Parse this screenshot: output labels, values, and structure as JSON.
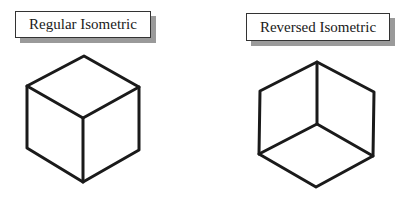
{
  "diagrams": [
    {
      "label": "Regular Isometric",
      "type": "cube",
      "view": "top-down (top face visible)"
    },
    {
      "label": "Reversed Isometric",
      "type": "cube",
      "view": "bottom-up (bottom face visible)"
    }
  ],
  "colors": {
    "line": "#1a1a1a",
    "label_shadow": "#9a9a9a",
    "background": "#ffffff"
  }
}
